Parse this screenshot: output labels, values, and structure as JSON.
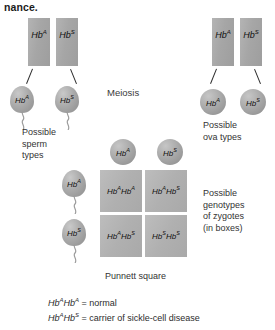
{
  "heading": {
    "cut_text": "nance."
  },
  "labels": {
    "meiosis": "Meiosis",
    "punnett_square": "Punnett square"
  },
  "captions": {
    "sperm": "Possible\nsperm\ntypes",
    "sperm_lines": [
      "Possible",
      "sperm",
      "types"
    ],
    "ova": "Possible\nova types",
    "ova_lines": [
      "Possible",
      "ova types"
    ],
    "zygotes": "Possible\ngenotypes\nof zygotes\n(in boxes)",
    "zygote_lines": [
      "Possible",
      "genotypes",
      "of zygotes",
      "(in boxes)"
    ]
  },
  "parents": {
    "father": {
      "chromosomes": [
        {
          "base": "Hb",
          "allele": "A"
        },
        {
          "base": "Hb",
          "allele": "S"
        }
      ],
      "gametes": [
        {
          "base": "Hb",
          "allele": "A",
          "type": "sperm"
        },
        {
          "base": "Hb",
          "allele": "S",
          "type": "sperm"
        }
      ]
    },
    "mother": {
      "chromosomes": [
        {
          "base": "Hb",
          "allele": "A"
        },
        {
          "base": "Hb",
          "allele": "S"
        }
      ],
      "gametes": [
        {
          "base": "Hb",
          "allele": "A",
          "type": "ovum"
        },
        {
          "base": "Hb",
          "allele": "S",
          "type": "ovum"
        }
      ]
    }
  },
  "punnett": {
    "column_gametes": [
      {
        "base": "Hb",
        "allele": "A"
      },
      {
        "base": "Hb",
        "allele": "S"
      }
    ],
    "row_gametes": [
      {
        "base": "Hb",
        "allele": "A"
      },
      {
        "base": "Hb",
        "allele": "S"
      }
    ],
    "cells": [
      {
        "a1": "A",
        "a2": "A",
        "text": "HbAHbA"
      },
      {
        "a1": "A",
        "a2": "S",
        "text": "HbAHbS"
      },
      {
        "a1": "A",
        "a2": "S",
        "text": "HbAHbS"
      },
      {
        "a1": "S",
        "a2": "S",
        "text": "HbSHbS"
      }
    ]
  },
  "legend": [
    {
      "genotype_allele_1": "A",
      "genotype_allele_2": "A",
      "meaning": "= normal"
    },
    {
      "genotype_allele_1": "A",
      "genotype_allele_2": "S",
      "meaning": "= carrier of sickle-cell disease"
    }
  ],
  "colors": {
    "chromosome": "#a8a8a8",
    "gamete": "#a9a9a9",
    "punnett_cell": "#b2b2b2",
    "text": "#222222",
    "background": "#ffffff"
  }
}
